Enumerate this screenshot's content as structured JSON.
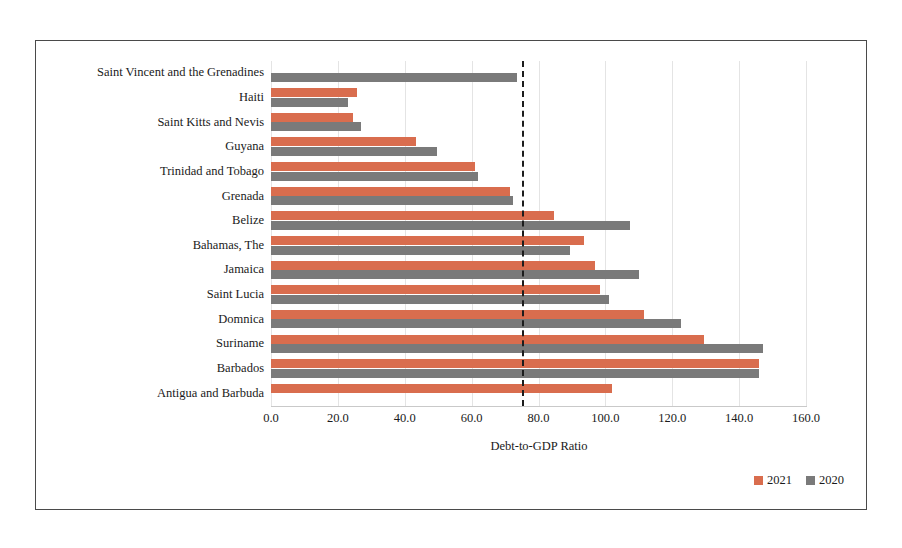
{
  "chart_data": {
    "type": "bar",
    "orientation": "horizontal",
    "title": "",
    "xlabel": "Debt-to-GDP Ratio",
    "ylabel": "",
    "xlim": [
      0.0,
      160.0
    ],
    "xticks": [
      "0.0",
      "20.0",
      "40.0",
      "60.0",
      "80.0",
      "100.0",
      "120.0",
      "140.0",
      "160.0"
    ],
    "xtick_values": [
      0,
      20,
      40,
      60,
      80,
      100,
      120,
      140,
      160
    ],
    "grid": true,
    "legend_position": "bottom-right",
    "categories": [
      "Saint Vincent and the Grenadines",
      "Haiti",
      "Saint Kitts and Nevis",
      "Guyana",
      "Trinidad and Tobago",
      "Grenada",
      "Belize",
      "Bahamas, The",
      "Jamaica",
      "Saint Lucia",
      "Domnica",
      "Suriname",
      "Barbados",
      "Antigua and Barbuda"
    ],
    "series": [
      {
        "name": "2021",
        "color": "#d96d4e",
        "values": [
          0,
          25.7,
          24.6,
          43.5,
          61.0,
          71.5,
          84.5,
          93.5,
          97.0,
          98.5,
          111.5,
          129.5,
          146.0,
          102.0
        ]
      },
      {
        "name": "2020",
        "color": "#7a7a7a",
        "values": [
          73.5,
          23.0,
          26.8,
          49.5,
          62.0,
          72.5,
          107.5,
          89.5,
          110.0,
          101.0,
          122.5,
          147.0,
          146.0,
          0
        ]
      }
    ],
    "annotations": [
      {
        "name": "threshold-line",
        "type": "vertical-dashed-line",
        "value": 75.0,
        "color": "#1c1c1c"
      }
    ]
  },
  "legend": {
    "items": [
      {
        "label": "2021",
        "color": "#d96d4e"
      },
      {
        "label": "2020",
        "color": "#7a7a7a"
      }
    ]
  }
}
